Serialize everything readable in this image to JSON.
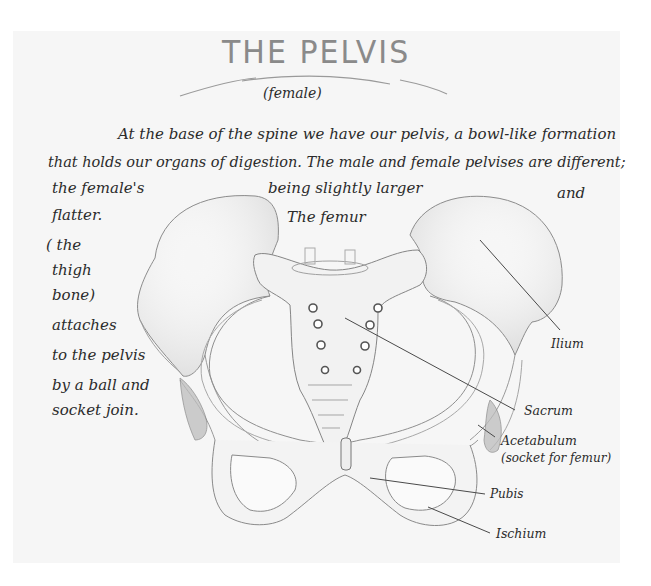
{
  "page": {
    "title": "THE PELVIS",
    "subtitle": "(female)"
  },
  "paragraph": {
    "line1": "At the base of the spine we have our pelvis, a bowl-like formation",
    "line2": "that holds our organs of digestion. The male and female pelvises are different;",
    "line3_left": "the female's",
    "line3_mid": "being slightly larger",
    "line3_right": "and",
    "line4_left": "flatter.",
    "line4_mid": "The femur"
  },
  "side_note": {
    "lines": [
      "( the",
      "thigh",
      "bone)",
      "attaches",
      "to the pelvis",
      "by a ball and",
      "socket join."
    ]
  },
  "labels": {
    "ilium": "Ilium",
    "sacrum": "Sacrum",
    "acetabulum": "Acetabulum",
    "acetabulum_note": "(socket for femur)",
    "pubis": "Pubis",
    "ischium": "Ischium"
  },
  "colors": {
    "paper": "#f6f6f6",
    "ink": "#2b2b2b",
    "pencil": "#8c8c8c",
    "title": "#8a8a8a"
  }
}
